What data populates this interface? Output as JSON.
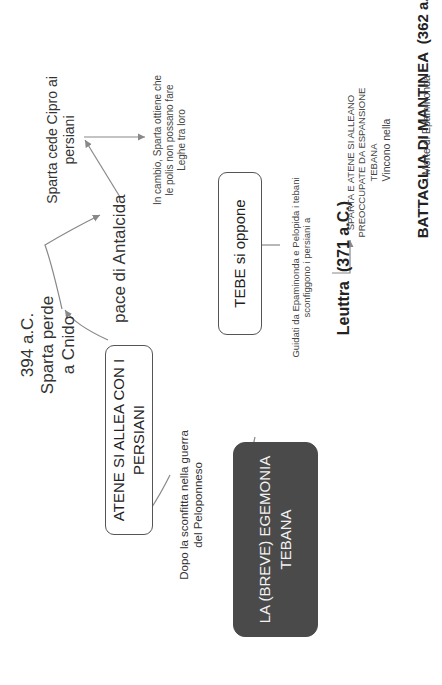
{
  "diagram": {
    "root": {
      "label": "LA (BREVE) EGEMONIA TEBANA",
      "color": "#4a4a4a"
    },
    "branch_left": {
      "connector_label": "Dopo la sconfitta nella guerra del Peloponneso",
      "box_label": "ATENE SI ALLEA CON I PERSIANI",
      "event": "394 a.C. Sparta perde a Cnido",
      "next": "pace di Antalcida",
      "outcome": "Sparta cede Cipro ai persiani",
      "consequence": "In cambio, Sparta ottiene che le polis non possano fare Leghe tra loro"
    },
    "branch_right": {
      "box_label": "TEBE si oppone",
      "description": "Guidati da Epaminonda e Pelopida i tebani sconfiggono i persiani a",
      "battle": "Leuttra  (371 a.C.)",
      "reaction": "SPARTA E ATENE SI ALLEANO PREOCCUPATE DA ESPANSIONE TEBANA",
      "result_intro": "Vincono nella",
      "final_battle": "BATTAGLIA DI MANTINEA  (362 a.C.)",
      "final_note": "- Morte di Epaminonda -"
    },
    "line_color": "#888888"
  }
}
